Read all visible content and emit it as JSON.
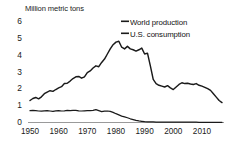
{
  "chart_data": {
    "type": "line",
    "title": "Million metric tons",
    "xlabel": "",
    "ylabel": "Million metric tons",
    "xlim": [
      1950,
      2017
    ],
    "ylim": [
      0,
      6
    ],
    "grid": false,
    "legend_position": "top-right",
    "yticks": [
      0,
      1,
      2,
      3,
      4,
      5,
      6
    ],
    "xticks": [
      1950,
      1960,
      1970,
      1980,
      1990,
      2000,
      2010
    ],
    "ytick_labels": [
      "0",
      "1",
      "2",
      "3",
      "4",
      "5",
      "6"
    ],
    "xtick_labels": [
      "1950",
      "1960",
      "1970",
      "1980",
      "1990",
      "2000",
      "2010"
    ],
    "series": [
      {
        "name": "World production",
        "color": "#1a1a1a",
        "x": [
          1950,
          1951,
          1952,
          1953,
          1954,
          1955,
          1956,
          1957,
          1958,
          1959,
          1960,
          1961,
          1962,
          1963,
          1964,
          1965,
          1966,
          1967,
          1968,
          1969,
          1970,
          1971,
          1972,
          1973,
          1974,
          1975,
          1976,
          1977,
          1978,
          1979,
          1980,
          1981,
          1982,
          1983,
          1984,
          1985,
          1986,
          1987,
          1988,
          1989,
          1990,
          1991,
          1992,
          1993,
          1994,
          1995,
          1996,
          1997,
          1998,
          1999,
          2000,
          2001,
          2002,
          2003,
          2004,
          2005,
          2006,
          2007,
          2008,
          2009,
          2010,
          2011,
          2012,
          2013,
          2014,
          2015,
          2016,
          2017
        ],
        "y": [
          1.3,
          1.42,
          1.48,
          1.4,
          1.52,
          1.7,
          1.8,
          1.88,
          1.84,
          1.95,
          2.05,
          2.12,
          2.3,
          2.32,
          2.45,
          2.6,
          2.7,
          2.72,
          2.62,
          2.7,
          2.95,
          3.05,
          3.22,
          3.35,
          3.3,
          3.55,
          3.75,
          4.05,
          4.35,
          4.6,
          4.75,
          4.8,
          4.45,
          4.35,
          4.5,
          4.35,
          4.3,
          4.22,
          4.3,
          4.4,
          4.05,
          4.1,
          3.35,
          2.55,
          2.3,
          2.2,
          2.15,
          2.1,
          2.18,
          2.05,
          1.95,
          2.1,
          2.25,
          2.35,
          2.3,
          2.32,
          2.28,
          2.25,
          2.3,
          2.2,
          2.15,
          2.08,
          2.0,
          1.9,
          1.7,
          1.5,
          1.3,
          1.18
        ],
        "unit": "million metric tons"
      },
      {
        "name": "U.S. consumption",
        "color": "#1a1a1a",
        "x": [
          1950,
          1951,
          1952,
          1953,
          1954,
          1955,
          1956,
          1957,
          1958,
          1959,
          1960,
          1961,
          1962,
          1963,
          1964,
          1965,
          1966,
          1967,
          1968,
          1969,
          1970,
          1971,
          1972,
          1973,
          1974,
          1975,
          1976,
          1977,
          1978,
          1979,
          1980,
          1981,
          1982,
          1983,
          1984,
          1985,
          1986,
          1987,
          1988,
          1989,
          1990,
          1991,
          1992,
          1993,
          1994,
          1995,
          1996,
          1997,
          1998,
          1999,
          2000,
          2001,
          2002,
          2003,
          2004,
          2005,
          2006,
          2007,
          2008,
          2009,
          2010,
          2011,
          2012,
          2013,
          2014,
          2015,
          2016,
          2017
        ],
        "y": [
          0.7,
          0.71,
          0.7,
          0.68,
          0.67,
          0.69,
          0.7,
          0.68,
          0.66,
          0.69,
          0.7,
          0.68,
          0.69,
          0.71,
          0.7,
          0.72,
          0.71,
          0.69,
          0.68,
          0.69,
          0.7,
          0.7,
          0.72,
          0.76,
          0.7,
          0.64,
          0.67,
          0.68,
          0.66,
          0.6,
          0.52,
          0.45,
          0.38,
          0.33,
          0.28,
          0.22,
          0.17,
          0.12,
          0.09,
          0.07,
          0.05,
          0.04,
          0.03,
          0.03,
          0.02,
          0.02,
          0.02,
          0.02,
          0.02,
          0.02,
          0.02,
          0.02,
          0.02,
          0.02,
          0.02,
          0.02,
          0.02,
          0.02,
          0.02,
          0.01,
          0.01,
          0.01,
          0.01,
          0.01,
          0.01,
          0.01,
          0.01,
          0.01
        ],
        "unit": "million metric tons"
      }
    ]
  },
  "legend": {
    "world_label": "World production",
    "us_label": "U.S. consumption"
  }
}
